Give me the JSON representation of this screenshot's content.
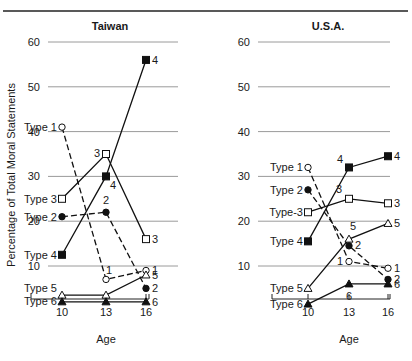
{
  "header": {
    "running_title": ""
  },
  "chart_data": {
    "type": "line",
    "ylabel": "Percentage of Total Moral Statements",
    "xlabel": "Age",
    "ylim": [
      0,
      60
    ],
    "yticks": [
      10,
      20,
      30,
      40,
      50,
      60
    ],
    "x": [
      10,
      13,
      16
    ],
    "xtick_labels": [
      "10",
      "13",
      "16"
    ],
    "grid": true,
    "panels": [
      {
        "title": "Taiwan",
        "series": [
          {
            "name": "Type 1",
            "id": "1",
            "marker": "open-circle",
            "dash": true,
            "values": [
              41,
              7,
              9
            ]
          },
          {
            "name": "Type 2",
            "id": "2",
            "marker": "filled-circle",
            "dash": true,
            "values": [
              21,
              22,
              5
            ]
          },
          {
            "name": "Type 3",
            "id": "3",
            "marker": "open-square",
            "dash": false,
            "values": [
              25,
              35,
              16
            ]
          },
          {
            "name": "Type 4",
            "id": "4",
            "marker": "filled-square",
            "dash": false,
            "values": [
              12.5,
              30,
              56
            ]
          },
          {
            "name": "Type 5",
            "id": "5",
            "marker": "open-triangle",
            "dash": false,
            "values": [
              3.5,
              3.5,
              8
            ]
          },
          {
            "name": "Type 6",
            "id": "6",
            "marker": "filled-triangle",
            "dash": false,
            "values": [
              2,
              2,
              2
            ]
          }
        ]
      },
      {
        "title": "U.S.A.",
        "series": [
          {
            "name": "Type 1",
            "id": "1",
            "marker": "open-circle",
            "dash": true,
            "values": [
              32,
              11,
              9.5
            ]
          },
          {
            "name": "Type 2",
            "id": "2",
            "marker": "filled-circle",
            "dash": true,
            "values": [
              27,
              14.5,
              7
            ]
          },
          {
            "name": "Type-3",
            "id": "3",
            "marker": "open-square",
            "dash": false,
            "values": [
              22,
              25,
              24
            ]
          },
          {
            "name": "Type 4",
            "id": "4",
            "marker": "filled-square",
            "dash": false,
            "values": [
              15.5,
              32,
              34.5
            ]
          },
          {
            "name": "Type 5",
            "id": "5",
            "marker": "open-triangle",
            "dash": false,
            "values": [
              5,
              16,
              19.5
            ]
          },
          {
            "name": "Type 6",
            "id": "6",
            "marker": "filled-triangle",
            "dash": false,
            "values": [
              1.5,
              6,
              6
            ]
          }
        ]
      }
    ]
  }
}
